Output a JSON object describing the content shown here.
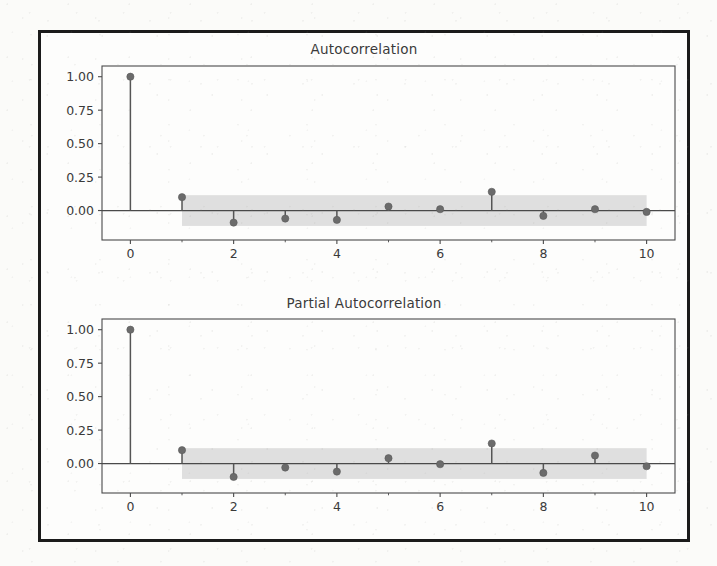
{
  "figure": {
    "background_color": "#fbfbf9",
    "frame_color": "#1b1b1b",
    "axes_color": "#4a4a4a",
    "stem_color": "#555555",
    "marker_color": "#6b6b6b",
    "band_color": "#d9d9d9",
    "tick_label_color": "#3a3a3a"
  },
  "chart_data": [
    {
      "type": "bar",
      "panel": "acf",
      "title": "Autocorrelation",
      "xlabel": "",
      "ylabel": "",
      "x": [
        0,
        1,
        2,
        3,
        4,
        5,
        6,
        7,
        8,
        9,
        10
      ],
      "categories": [
        "0",
        "1",
        "2",
        "3",
        "4",
        "5",
        "6",
        "7",
        "8",
        "9",
        "10"
      ],
      "values": [
        1.0,
        0.1,
        -0.09,
        -0.06,
        -0.07,
        0.03,
        0.01,
        0.14,
        -0.04,
        0.01,
        -0.01
      ],
      "series": [
        {
          "name": "Autocorrelation",
          "values": [
            1.0,
            0.1,
            -0.09,
            -0.06,
            -0.07,
            0.03,
            0.01,
            0.14,
            -0.04,
            0.01,
            -0.01
          ]
        }
      ],
      "confidence_band": {
        "upper": 0.115,
        "lower": -0.115,
        "start_lag": 1,
        "end_lag": 10,
        "color": "#d9d9d9"
      },
      "xlim": [
        -0.55,
        10.55
      ],
      "ylim": [
        -0.22,
        1.08
      ],
      "xticks": [
        0,
        2,
        4,
        6,
        8,
        10
      ],
      "xticklabels": [
        "0",
        "2",
        "4",
        "6",
        "8",
        "10"
      ],
      "xminorticks": [
        1,
        3,
        5,
        7,
        9
      ],
      "yticks": [
        0.0,
        0.25,
        0.5,
        0.75,
        1.0
      ],
      "yticklabels": [
        "0.00",
        "0.25",
        "0.50",
        "0.75",
        "1.00"
      ],
      "grid": false,
      "legend": "none"
    },
    {
      "type": "bar",
      "panel": "pacf",
      "title": "Partial Autocorrelation",
      "xlabel": "",
      "ylabel": "",
      "x": [
        0,
        1,
        2,
        3,
        4,
        5,
        6,
        7,
        8,
        9,
        10
      ],
      "categories": [
        "0",
        "1",
        "2",
        "3",
        "4",
        "5",
        "6",
        "7",
        "8",
        "9",
        "10"
      ],
      "values": [
        1.0,
        0.1,
        -0.1,
        -0.03,
        -0.06,
        0.04,
        -0.005,
        0.15,
        -0.07,
        0.06,
        -0.02
      ],
      "series": [
        {
          "name": "Partial Autocorrelation",
          "values": [
            1.0,
            0.1,
            -0.1,
            -0.03,
            -0.06,
            0.04,
            -0.005,
            0.15,
            -0.07,
            0.06,
            -0.02
          ]
        }
      ],
      "confidence_band": {
        "upper": 0.115,
        "lower": -0.115,
        "start_lag": 1,
        "end_lag": 10,
        "color": "#d9d9d9"
      },
      "xlim": [
        -0.55,
        10.55
      ],
      "ylim": [
        -0.22,
        1.08
      ],
      "xticks": [
        0,
        2,
        4,
        6,
        8,
        10
      ],
      "xticklabels": [
        "0",
        "2",
        "4",
        "6",
        "8",
        "10"
      ],
      "xminorticks": [
        1,
        3,
        5,
        7,
        9
      ],
      "yticks": [
        0.0,
        0.25,
        0.5,
        0.75,
        1.0
      ],
      "yticklabels": [
        "0.00",
        "0.25",
        "0.50",
        "0.75",
        "1.00"
      ],
      "grid": false,
      "legend": "none"
    }
  ]
}
